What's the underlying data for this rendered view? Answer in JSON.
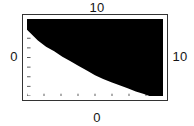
{
  "figure": {
    "title": "",
    "background_color": "#ffffff",
    "frame_color": "#333333",
    "region_fill_color": "#000000",
    "region_empty_color": "#ffffff"
  },
  "labels": {
    "top": "10",
    "bottom": "0",
    "left": "0",
    "right": "10"
  },
  "chart_data": {
    "type": "area",
    "title": "",
    "xlabel": "",
    "ylabel": "",
    "xlim": [
      0,
      10
    ],
    "ylim": [
      0,
      10
    ],
    "grid": false,
    "legend": null,
    "frame": true,
    "tick_labels": {
      "top": "10",
      "bottom": "0",
      "left": "0",
      "right": "10"
    },
    "x_ticks": [
      0,
      1.25,
      2.5,
      3.75,
      5,
      6.25,
      7.5,
      8.75,
      10
    ],
    "y_ticks": [
      0,
      1.25,
      2.5,
      3.75,
      5,
      6.25,
      7.5,
      8.75,
      10
    ],
    "series": [
      {
        "name": "region-boundary",
        "x": [
          0.0,
          0.3,
          0.8,
          1.4,
          2.0,
          2.6,
          3.2,
          3.8,
          4.4,
          5.0,
          5.6,
          6.2,
          6.8,
          7.4,
          8.0,
          8.6,
          9.0
        ],
        "y": [
          8.6,
          8.1,
          7.2,
          6.4,
          5.8,
          5.1,
          4.5,
          3.9,
          3.3,
          2.7,
          2.2,
          1.8,
          1.4,
          1.0,
          0.6,
          0.25,
          0.0
        ]
      }
    ],
    "fill": "above"
  }
}
